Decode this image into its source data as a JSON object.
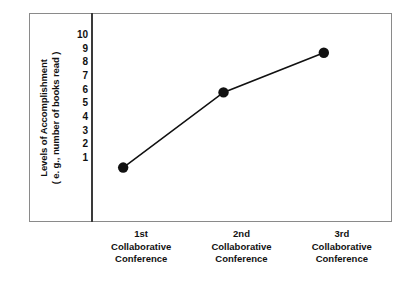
{
  "chart_data": {
    "type": "line",
    "title": "",
    "subtitle": "",
    "xlabel": "",
    "ylabel": "Levels of Accomplishment ( e. g., number of books read )",
    "ylabel_lines": [
      "Levels of Accomplishment",
      "( e. g., number of books read )"
    ],
    "categories": [
      "1st Collaborative Conference",
      "2nd Collaborative Conference",
      "3rd Collaborative Conference"
    ],
    "category_lines": [
      [
        "1st",
        "Collaborative",
        "Conference"
      ],
      [
        "2nd",
        "Collaborative",
        "Conference"
      ],
      [
        "3rd",
        "Collaborative",
        "Conference"
      ]
    ],
    "values": [
      0.3,
      5.8,
      8.7
    ],
    "ylim": [
      0,
      10.4
    ],
    "yticks": [
      10,
      9,
      8,
      7,
      6,
      5,
      4,
      3,
      2,
      1
    ],
    "ytick_labels": [
      "10",
      "9",
      "8",
      "7",
      "6",
      "5",
      "4",
      "3",
      "2",
      "1"
    ],
    "grid": false,
    "legend": null,
    "marker": "filled-circle",
    "marker_color": "#111111",
    "line_color": "#111111",
    "frame_color": "#8a8a8a",
    "axis_color": "#3a3a3a",
    "background": "#ffffff"
  }
}
